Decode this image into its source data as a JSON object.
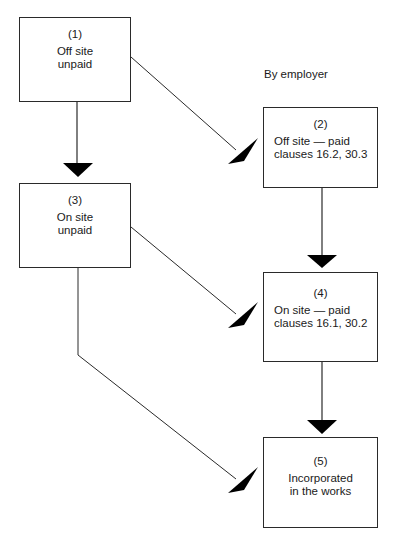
{
  "diagram": {
    "annotation": "By employer",
    "nodes": [
      {
        "id": "1",
        "number": "(1)",
        "lines": [
          "Off site",
          "unpaid"
        ]
      },
      {
        "id": "2",
        "number": "(2)",
        "lines": [
          "Off site — paid",
          "clauses 16.2, 30.3"
        ]
      },
      {
        "id": "3",
        "number": "(3)",
        "lines": [
          "On site",
          "unpaid"
        ]
      },
      {
        "id": "4",
        "number": "(4)",
        "lines": [
          "On site — paid",
          "clauses 16.1, 30.2"
        ]
      },
      {
        "id": "5",
        "number": "(5)",
        "lines": [
          "Incorporated",
          "in the works"
        ]
      }
    ],
    "edges": [
      {
        "from": "1",
        "to": "3",
        "style": "vertical"
      },
      {
        "from": "1",
        "to": "2",
        "style": "diagonal"
      },
      {
        "from": "2",
        "to": "4",
        "style": "vertical"
      },
      {
        "from": "3",
        "to": "4",
        "style": "diagonal"
      },
      {
        "from": "4",
        "to": "5",
        "style": "vertical"
      },
      {
        "from": "3",
        "to": "5",
        "style": "elbow"
      }
    ],
    "colors": {
      "line": "#2a2a2a",
      "arrowhead": "#000000",
      "background": "#ffffff"
    }
  }
}
